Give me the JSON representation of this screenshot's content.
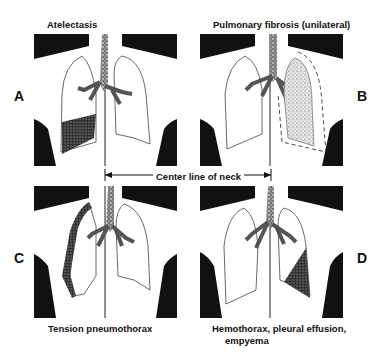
{
  "figure": {
    "center_line_label": "Center line of neck",
    "panels": [
      {
        "letter": "A",
        "title": "Atelectasis"
      },
      {
        "letter": "B",
        "title": "Pulmonary fibrosis (unilateral)"
      },
      {
        "letter": "C",
        "title": "Tension pneumothorax",
        "title_line2": ""
      },
      {
        "letter": "D",
        "title": "Hemothorax, pleural effusion,",
        "title_line2": "empyema"
      }
    ]
  }
}
